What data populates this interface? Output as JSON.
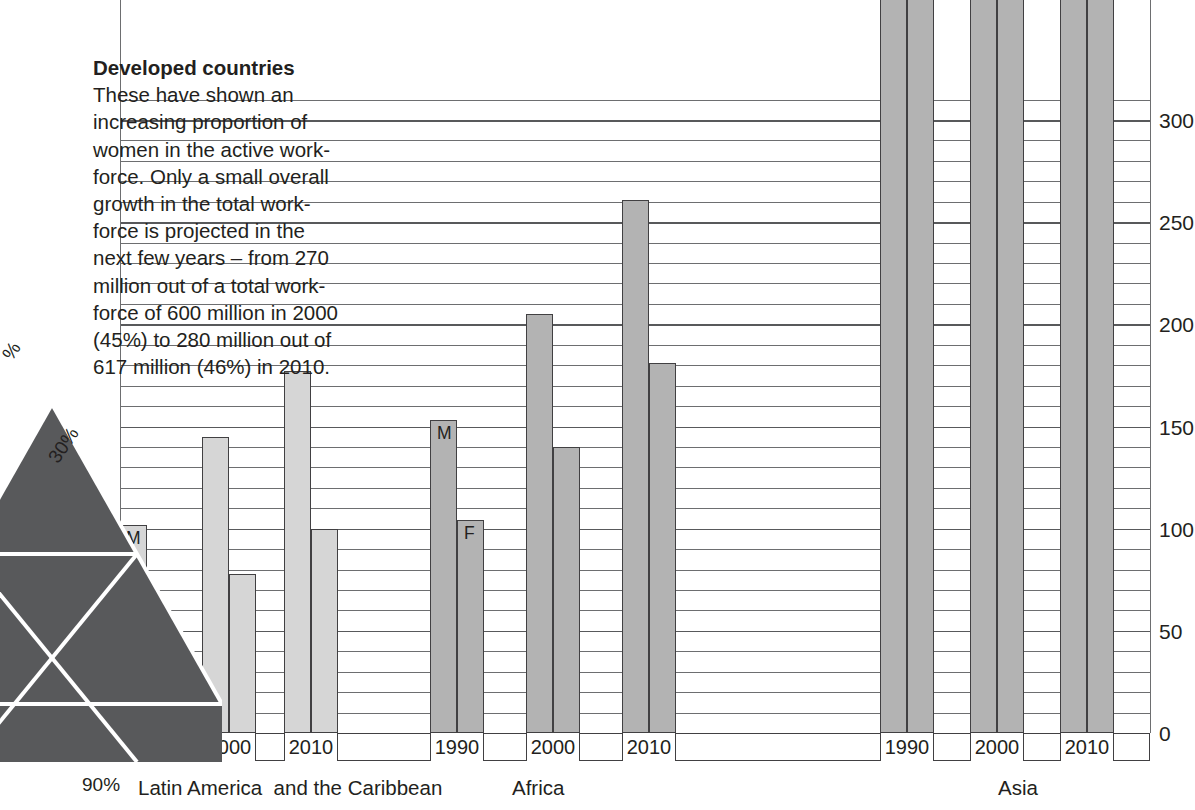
{
  "annotation": {
    "heading": "Developed countries",
    "body": "These have shown an\nincreasing proportion of\nwomen in the active work-\nforce. Only a small overall\ngrowth in the total work-\nforce is projected in the\nnext few years – from 270\nmillion out of a total work-\nforce of 600 million in 2000\n(45%) to 280 million out of\n617 million (46%) in 2010."
  },
  "triangle": {
    "label_top": "%",
    "label_mid": "30%",
    "label_bottom": "90%",
    "fill": "#58595b"
  },
  "series_labels": {
    "male": "M",
    "female": "F"
  },
  "colors": {
    "bar_light": "#d6d6d6",
    "bar_mid": "#b3b3b3",
    "bar_outline": "#414042",
    "gridline": "#6d6e70",
    "text": "#231f20"
  },
  "chart_data": {
    "type": "bar",
    "title": "",
    "xlabel": "",
    "ylabel": "",
    "ylim": [
      0,
      310
    ],
    "grid": true,
    "major_tick_step": 50,
    "minor_tick_step": 10,
    "legend": [
      "M",
      "F"
    ],
    "ytick_labels": [
      "0",
      "50",
      "100",
      "150",
      "200",
      "250",
      "300"
    ],
    "ytick_values": [
      0,
      50,
      100,
      150,
      200,
      250,
      300
    ],
    "groups": [
      {
        "name": "Latin America  and the Caribbean",
        "shade": "light",
        "years": [
          "1990",
          "2000",
          "2010"
        ],
        "series": [
          {
            "name": "M",
            "values": [
              102,
              145,
              177
            ]
          },
          {
            "name": "F",
            "values": [
              53,
              78,
              100
            ]
          }
        ]
      },
      {
        "name": "Africa",
        "shade": "mid",
        "years": [
          "1990",
          "2000",
          "2010"
        ],
        "series": [
          {
            "name": "M",
            "values": [
              153,
              205,
              261
            ]
          },
          {
            "name": "F",
            "values": [
              104,
              140,
              181
            ]
          }
        ]
      },
      {
        "name": "Asia",
        "shade": "mid",
        "years": [
          "1990",
          "2000",
          "2010"
        ],
        "series": [
          {
            "name": "M",
            "values": [
              400,
              400,
              400
            ]
          },
          {
            "name": "F",
            "values": [
              400,
              400,
              400
            ]
          }
        ],
        "clipped_above_top": true
      }
    ]
  }
}
